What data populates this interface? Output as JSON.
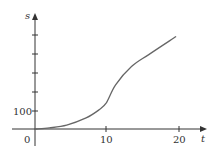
{
  "chart_data": {
    "type": "line",
    "title": "",
    "xlabel": "t",
    "ylabel": "s",
    "origin_label": "0",
    "x_ticks": [
      10,
      20
    ],
    "x_tick_labels": [
      "10",
      "20"
    ],
    "y_ticks": [
      100,
      200,
      300,
      400,
      500
    ],
    "y_tick_labels": [
      "100"
    ],
    "xlim": [
      0,
      23
    ],
    "ylim": [
      0,
      610
    ],
    "grid": false,
    "legend": null,
    "series": [
      {
        "name": "s(t)",
        "x": [
          0,
          2,
          4.4,
          7.1,
          8.9,
          9.9,
          11.2,
          13.4,
          15.8,
          19.6
        ],
        "values": [
          0,
          6,
          21,
          59,
          102,
          139,
          235,
          332,
          396,
          492
        ]
      }
    ],
    "colors": {
      "curve": "#666666",
      "axis": "#333333"
    }
  }
}
